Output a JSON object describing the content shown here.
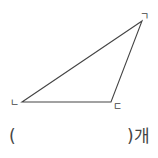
{
  "figure": {
    "shape": "triangle",
    "vertices": [
      {
        "label": "ㄱ",
        "x": 142,
        "y": 21
      },
      {
        "label": "ㄴ",
        "x": 22,
        "y": 102
      },
      {
        "label": "ㄷ",
        "x": 111,
        "y": 102
      }
    ]
  },
  "answer": {
    "open_paren": "(",
    "close_paren_unit": ")개",
    "value": ""
  }
}
